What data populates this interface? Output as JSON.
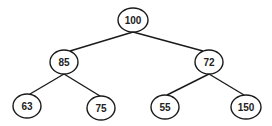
{
  "diagram": {
    "type": "binary-tree",
    "colors": {
      "stroke": "#1a1a1a",
      "fill": "#ffffff",
      "text": "#222222"
    },
    "nodes": [
      {
        "id": "n100",
        "label": "100",
        "cx": 133,
        "cy": 20,
        "rx": 15,
        "ry": 12
      },
      {
        "id": "n85",
        "label": "85",
        "cx": 64,
        "cy": 62,
        "rx": 14,
        "ry": 12
      },
      {
        "id": "n72",
        "label": "72",
        "cx": 209,
        "cy": 62,
        "rx": 14,
        "ry": 12
      },
      {
        "id": "n63",
        "label": "63",
        "cx": 27,
        "cy": 106,
        "rx": 14,
        "ry": 12
      },
      {
        "id": "n75",
        "label": "75",
        "cx": 101,
        "cy": 108,
        "rx": 14,
        "ry": 12
      },
      {
        "id": "n55",
        "label": "55",
        "cx": 165,
        "cy": 107,
        "rx": 14,
        "ry": 12
      },
      {
        "id": "n150",
        "label": "150",
        "cx": 246,
        "cy": 107,
        "rx": 15,
        "ry": 12
      }
    ],
    "edges": [
      {
        "from": "n100",
        "to": "n85"
      },
      {
        "from": "n100",
        "to": "n72"
      },
      {
        "from": "n85",
        "to": "n63"
      },
      {
        "from": "n85",
        "to": "n75"
      },
      {
        "from": "n72",
        "to": "n55"
      },
      {
        "from": "n72",
        "to": "n150"
      }
    ]
  }
}
